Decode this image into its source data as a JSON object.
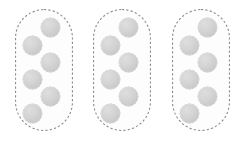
{
  "figure": {
    "type": "grouping-diagram",
    "background_color": "#ffffff",
    "group_count": 3,
    "dots_per_group": 6,
    "total_dots": 18,
    "dot_color": "#d2d2d2",
    "dot_edge_color": "#bdbdbd",
    "outline_color": "#8c8c8c",
    "outline_style": "dashed",
    "outline_width": 1.1,
    "outline_dash": "2.2 2.2",
    "group_fill": "#fdfdfd",
    "dot_diameter": 19
  },
  "chart_data": {
    "type": "scatter",
    "title": "",
    "xlabel": "",
    "ylabel": "",
    "grid": false,
    "legend": null,
    "xlim": [
      0,
      249
    ],
    "ylim": [
      0,
      144
    ],
    "groups": [
      {
        "name": "group-1",
        "count": 6,
        "box": {
          "x": 15,
          "y": 9,
          "width": 58,
          "height": 122,
          "radius": 29
        },
        "points": [
          {
            "cx": 50,
            "cy": 27
          },
          {
            "cx": 32,
            "cy": 45
          },
          {
            "cx": 50,
            "cy": 62
          },
          {
            "cx": 32,
            "cy": 79
          },
          {
            "cx": 50,
            "cy": 96
          },
          {
            "cx": 32,
            "cy": 113
          }
        ]
      },
      {
        "name": "group-2",
        "count": 6,
        "box": {
          "x": 93,
          "y": 9,
          "width": 58,
          "height": 122,
          "radius": 29
        },
        "points": [
          {
            "cx": 128,
            "cy": 27
          },
          {
            "cx": 110,
            "cy": 45
          },
          {
            "cx": 128,
            "cy": 62
          },
          {
            "cx": 110,
            "cy": 79
          },
          {
            "cx": 128,
            "cy": 96
          },
          {
            "cx": 110,
            "cy": 113
          }
        ]
      },
      {
        "name": "group-3",
        "count": 6,
        "box": {
          "x": 172,
          "y": 9,
          "width": 58,
          "height": 122,
          "radius": 29
        },
        "points": [
          {
            "cx": 207,
            "cy": 27
          },
          {
            "cx": 189,
            "cy": 45
          },
          {
            "cx": 207,
            "cy": 62
          },
          {
            "cx": 189,
            "cy": 79
          },
          {
            "cx": 207,
            "cy": 96
          },
          {
            "cx": 189,
            "cy": 113
          }
        ]
      }
    ]
  }
}
